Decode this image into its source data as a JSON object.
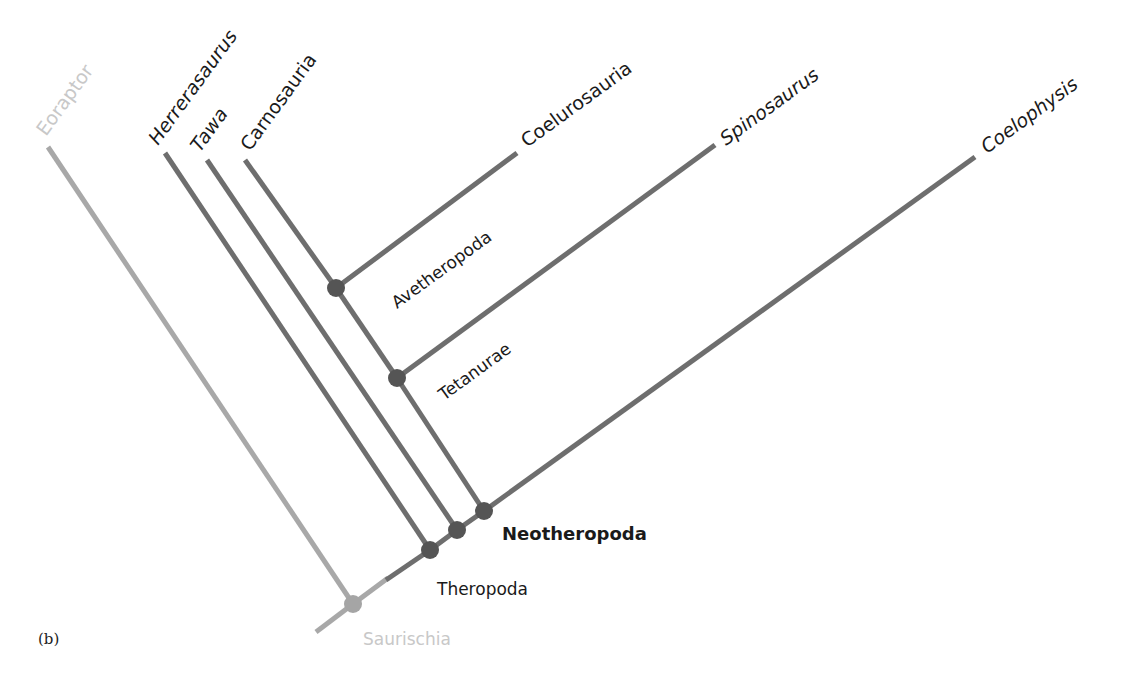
{
  "figure": {
    "panel_label": "(b)",
    "colors": {
      "branch_dark": "#6e6e6e",
      "branch_light": "#a8a8a8",
      "node_dark": "#555555",
      "node_light": "#a5a5a5",
      "label_dark": "#1a1a1a",
      "label_faded": "#c8c8c8"
    }
  },
  "taxa": [
    {
      "name": "Eoraptor",
      "style": "faded"
    },
    {
      "name": "Herrerasaurus",
      "style": "italic"
    },
    {
      "name": "Tawa",
      "style": "italic"
    },
    {
      "name": "Carnosauria",
      "style": "normal"
    },
    {
      "name": "Coelurosauria",
      "style": "normal"
    },
    {
      "name": "Spinosaurus",
      "style": "italic"
    },
    {
      "name": "Coelophysis",
      "style": "italic"
    }
  ],
  "clades": [
    {
      "name": "Saurischia",
      "style": "faded"
    },
    {
      "name": "Theropoda",
      "style": "normal"
    },
    {
      "name": "Neotheropoda",
      "style": "bold"
    },
    {
      "name": "Tetanurae",
      "style": "normal"
    },
    {
      "name": "Avetheropoda",
      "style": "normal"
    }
  ],
  "labels": {
    "eoraptor": "Eoraptor",
    "herrerasaurus": "Herrerasaurus",
    "tawa": "Tawa",
    "carnosauria": "Carnosauria",
    "coelurosauria": "Coelurosauria",
    "spinosaurus": "Spinosaurus",
    "coelophysis": "Coelophysis",
    "saurischia": "Saurischia",
    "theropoda": "Theropoda",
    "neotheropoda": "Neotheropoda",
    "tetanurae": "Tetanurae",
    "avetheropoda": "Avetheropoda"
  }
}
